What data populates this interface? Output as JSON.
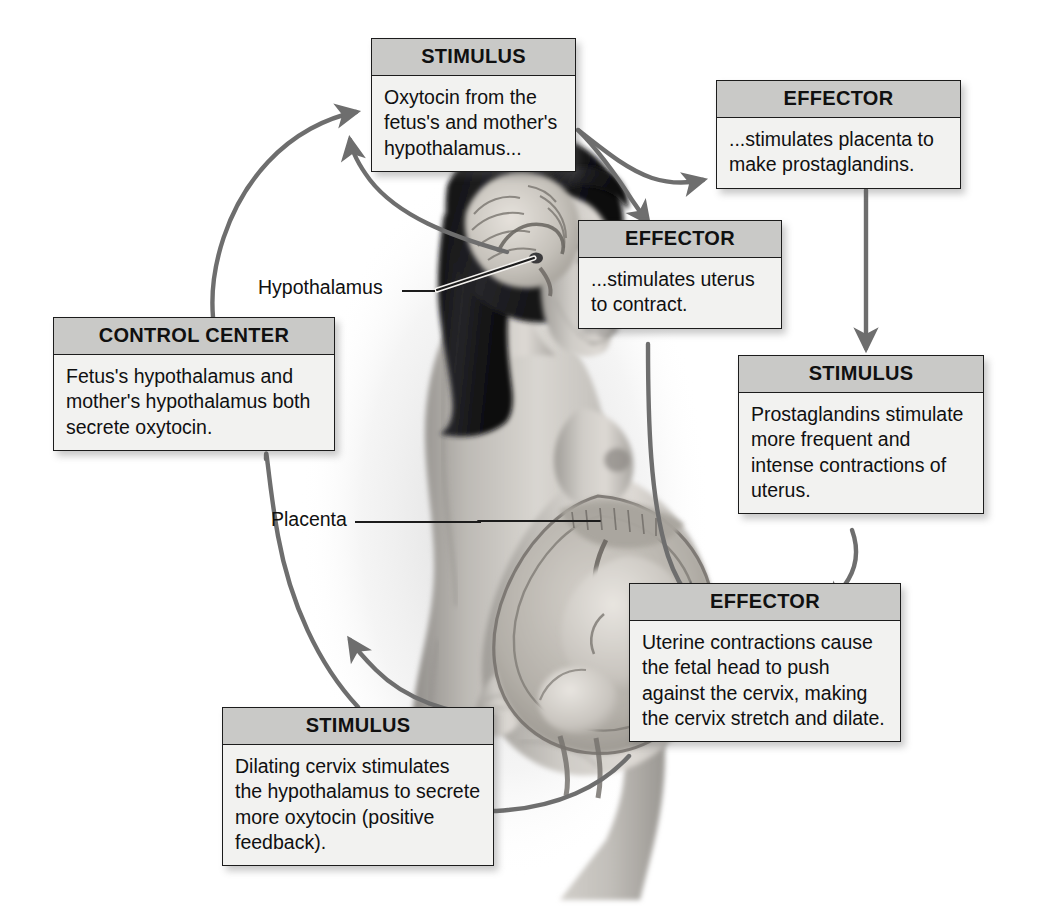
{
  "diagram": {
    "colors": {
      "header_fill": "#c9c9c7",
      "body_fill": "#f2f2f0",
      "border": "#1c1c1c",
      "arrow": "#6e6e6e",
      "text": "#101010"
    }
  },
  "nodes": {
    "stimulus_oxytocin": {
      "header": "STIMULUS",
      "body": "Oxytocin from the fetus's and mother's hypothalamus..."
    },
    "effector_placenta": {
      "header": "EFFECTOR",
      "body": "...stimulates placenta to make prostaglandins."
    },
    "effector_uterus": {
      "header": "EFFECTOR",
      "body": "...stimulates uterus to contract."
    },
    "stimulus_prostaglandins": {
      "header": "STIMULUS",
      "body": "Prostaglandins stimulate more frequent and intense contractions of uterus."
    },
    "effector_cervix": {
      "header": "EFFECTOR",
      "body": "Uterine contractions cause the fetal head to push against the cervix, making the cervix stretch and dilate."
    },
    "stimulus_cervix": {
      "header": "STIMULUS",
      "body": "Dilating cervix stimulates the hypothalamus to secrete more oxytocin (positive feedback)."
    },
    "control_center": {
      "header": "CONTROL CENTER",
      "body": "Fetus's hypothalamus and mother's hypothalamus both secrete oxytocin."
    }
  },
  "callouts": {
    "hypothalamus": "Hypothalamus",
    "placenta": "Placenta"
  },
  "illustration": {
    "name": "pregnant-woman-sagittal-illustration",
    "alt": "Side view of a pregnant woman showing brain with hypothalamus and uterus with fetus and placenta"
  },
  "arrows": [
    {
      "name": "control-center-to-stimulus-oxytocin",
      "from": "control_center",
      "to": "stimulus_oxytocin",
      "head": "to"
    },
    {
      "name": "hypothalamus-to-stimulus-oxytocin",
      "from": "illustration_hypothalamus",
      "to": "stimulus_oxytocin",
      "head": "to"
    },
    {
      "name": "stimulus-oxytocin-to-effector-placenta",
      "from": "stimulus_oxytocin",
      "to": "effector_placenta",
      "head": "to"
    },
    {
      "name": "stimulus-oxytocin-to-effector-uterus",
      "from": "stimulus_oxytocin",
      "to": "effector_uterus",
      "head": "to"
    },
    {
      "name": "effector-placenta-to-stimulus-prostaglandins",
      "from": "effector_placenta",
      "to": "stimulus_prostaglandins",
      "head": "to"
    },
    {
      "name": "stimulus-prostaglandins-to-effector-cervix",
      "from": "stimulus_prostaglandins",
      "to": "effector_cervix",
      "head": "to"
    },
    {
      "name": "effector-uterus-to-effector-cervix",
      "from": "effector_uterus",
      "to": "effector_cervix",
      "head": "to"
    },
    {
      "name": "effector-cervix-to-stimulus-cervix",
      "from": "effector_cervix",
      "to": "stimulus_cervix",
      "head": "none"
    },
    {
      "name": "stimulus-cervix-to-control-center",
      "from": "stimulus_cervix",
      "to": "control_center",
      "head": "none"
    },
    {
      "name": "placenta-to-control-center-loop",
      "from": "illustration_placenta",
      "to": "control_center",
      "head": "to"
    }
  ]
}
